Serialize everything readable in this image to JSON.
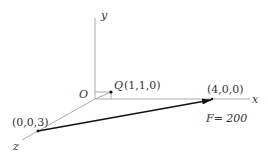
{
  "diagram": {
    "axes": {
      "x_label": "x",
      "y_label": "y",
      "z_label": "z",
      "origin_label": "O"
    },
    "points": {
      "Q": {
        "name": "Q",
        "coords": "(1,1,0)"
      },
      "A": {
        "coords": "(4,0,0)"
      },
      "B": {
        "coords": "(0,0,3)"
      }
    },
    "force": {
      "label": "F= 200"
    },
    "colors": {
      "axis": "#aaaaaa",
      "arrow": "#111111",
      "text": "#333333"
    }
  }
}
